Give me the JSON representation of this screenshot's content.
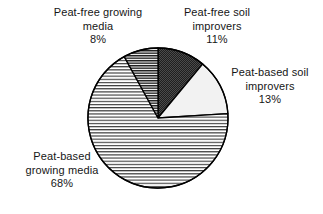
{
  "chart_data": {
    "type": "pie",
    "title": "",
    "categories": [
      "Peat-free soil improvers",
      "Peat-based soil improvers",
      "Peat-based growing media",
      "Peat-free growing media"
    ],
    "values": [
      11,
      13,
      68,
      8
    ],
    "value_labels": [
      "11%",
      "13%",
      "68%",
      "8%"
    ],
    "units": "percent",
    "start_angle_deg": 0,
    "direction": "clockwise",
    "legend_position": "outside-labels",
    "grid": false,
    "slices": [
      {
        "name": "peat-free-soil-improvers",
        "label_line1": "Peat-free soil",
        "label_line2": "improvers",
        "value": 11,
        "value_text": "11%",
        "fill_style": "dark-stipple",
        "fill_color": "#252525"
      },
      {
        "name": "peat-based-soil-improvers",
        "label_line1": "Peat-based soil",
        "label_line2": "improvers",
        "value": 13,
        "value_text": "13%",
        "fill_style": "light-solid",
        "fill_color": "#f2f2f2"
      },
      {
        "name": "peat-based-growing-media",
        "label_line1": "Peat-based",
        "label_line2": "growing media",
        "value": 68,
        "value_text": "68%",
        "fill_style": "horizontal-lines-wide",
        "fill_color": "#ffffff"
      },
      {
        "name": "peat-free-growing-media",
        "label_line1": "Peat-free growing",
        "label_line2": "media",
        "value": 8,
        "value_text": "8%",
        "fill_style": "horizontal-lines-dense",
        "fill_color": "#ffffff"
      }
    ],
    "outline_color": "#000000",
    "background_color": "#ffffff"
  }
}
